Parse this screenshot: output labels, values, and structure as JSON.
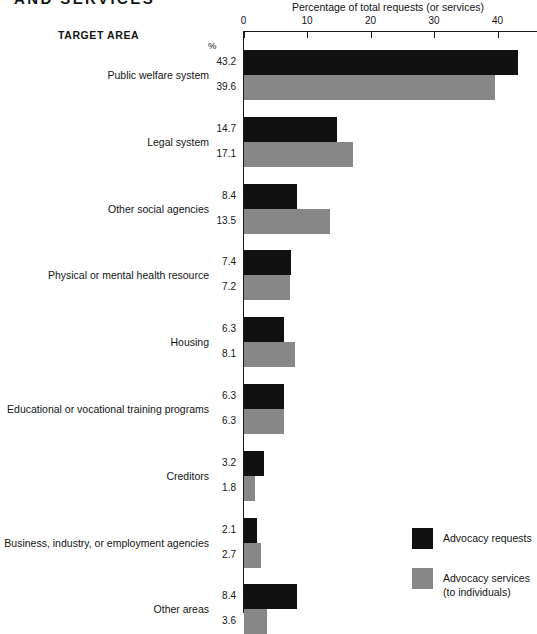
{
  "heading": "AND SERVICES",
  "target_area_header": "TARGET AREA",
  "percent_symbol": "%",
  "axis": {
    "title": "Percentage of total requests (or services)",
    "ticks": [
      "0",
      "10",
      "20",
      "30",
      "40"
    ]
  },
  "legend": {
    "items": [
      {
        "label": "Advocacy requests",
        "label2": "",
        "color": "#111111",
        "swatch_name": "legend-swatch-requests"
      },
      {
        "label": "Advocacy services",
        "label2": "(to individuals)",
        "color": "#878787",
        "swatch_name": "legend-swatch-services"
      }
    ]
  },
  "chart_data": {
    "type": "bar",
    "orientation": "horizontal",
    "title": "AND SERVICES",
    "xlabel": "Percentage of total requests (or services)",
    "ylabel": "TARGET AREA",
    "xlim": [
      0,
      46
    ],
    "xticks": [
      0,
      10,
      20,
      30,
      40
    ],
    "grid": false,
    "legend_position": "bottom-right",
    "value_unit": "%",
    "categories": [
      "Public welfare system",
      "Legal system",
      "Other social agencies",
      "Physical or mental health resource",
      "Housing",
      "Educational or vocational training programs",
      "Creditors",
      "Business, industry, or employment agencies",
      "Other areas"
    ],
    "series": [
      {
        "name": "Advocacy requests",
        "color": "#111111",
        "values": [
          43.2,
          14.7,
          8.4,
          7.4,
          6.3,
          6.3,
          3.2,
          2.1,
          8.4
        ]
      },
      {
        "name": "Advocacy services (to individuals)",
        "color": "#878787",
        "values": [
          39.6,
          17.1,
          13.5,
          7.2,
          8.1,
          6.3,
          1.8,
          2.7,
          3.6
        ]
      }
    ]
  }
}
